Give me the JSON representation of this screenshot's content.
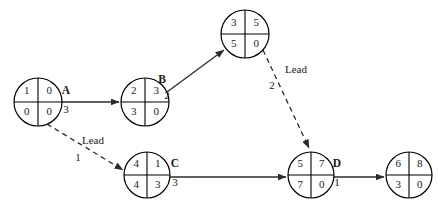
{
  "diagram": {
    "type": "precedence-network-diagram",
    "background": "#ffffff",
    "line_color": "#2b2b2b",
    "text_color": "#1a1a1a",
    "nodes": [
      {
        "id": "node-1",
        "cx": 38,
        "cy": 102,
        "r": 24,
        "top_left": "1",
        "top_right": "0",
        "bottom_left": "0",
        "bottom_right": "0"
      },
      {
        "id": "node-2",
        "cx": 145,
        "cy": 102,
        "r": 24,
        "top_left": "2",
        "top_right": "3",
        "bottom_left": "3",
        "bottom_right": "0"
      },
      {
        "id": "node-3",
        "cx": 245,
        "cy": 34,
        "r": 24,
        "top_left": "3",
        "top_right": "5",
        "bottom_left": "5",
        "bottom_right": "0"
      },
      {
        "id": "node-4",
        "cx": 147,
        "cy": 175,
        "r": 23,
        "top_left": "4",
        "top_right": "1",
        "bottom_left": "4",
        "bottom_right": "3"
      },
      {
        "id": "node-5",
        "cx": 311,
        "cy": 175,
        "r": 23,
        "top_left": "5",
        "top_right": "7",
        "bottom_left": "7",
        "bottom_right": "0"
      },
      {
        "id": "node-6",
        "cx": 409,
        "cy": 175,
        "r": 23,
        "top_left": "6",
        "top_right": "8",
        "bottom_left": "3",
        "bottom_right": "0"
      }
    ],
    "activities": [
      {
        "id": "activity-a",
        "label": "A",
        "duration": "3",
        "label_x": 66,
        "label_y": 91,
        "dur_x": 66,
        "dur_y": 110
      },
      {
        "id": "activity-b",
        "label": "B",
        "duration": "2",
        "label_x": 162,
        "label_y": 80,
        "dur_x": 167,
        "dur_y": 96
      },
      {
        "id": "activity-c",
        "label": "C",
        "duration": "3",
        "label_x": 175,
        "label_y": 164,
        "dur_x": 175,
        "dur_y": 183
      },
      {
        "id": "activity-d",
        "label": "D",
        "duration": "1",
        "label_x": 337,
        "label_y": 164,
        "dur_x": 337,
        "dur_y": 183
      }
    ],
    "leads": [
      {
        "id": "lead-1",
        "label": "Lead",
        "value": "1",
        "label_x": 93,
        "label_y": 141,
        "value_x": 78,
        "value_y": 158
      },
      {
        "id": "lead-2",
        "label": "Lead",
        "value": "2",
        "label_x": 296,
        "label_y": 70,
        "value_x": 272,
        "value_y": 86
      }
    ],
    "links": [
      {
        "id": "link-a",
        "style": "solid",
        "from": "node-1",
        "to": "node-2",
        "x1": 62,
        "y1": 102,
        "x2": 119,
        "y2": 102
      },
      {
        "id": "link-b",
        "style": "solid",
        "from": "node-2",
        "to": "node-3",
        "x1": 167,
        "y1": 92,
        "x2": 224,
        "y2": 50
      },
      {
        "id": "link-c",
        "style": "solid",
        "from": "node-4",
        "to": "node-5",
        "x1": 170,
        "y1": 177,
        "x2": 286,
        "y2": 177
      },
      {
        "id": "link-d",
        "style": "solid",
        "from": "node-5",
        "to": "node-6",
        "x1": 334,
        "y1": 177,
        "x2": 384,
        "y2": 177
      },
      {
        "id": "link-lead-1",
        "style": "dashed",
        "from": "node-1",
        "to": "node-4",
        "x1": 47,
        "y1": 124,
        "x2": 123,
        "y2": 170
      },
      {
        "id": "link-lead-2",
        "style": "dashed",
        "from": "node-3",
        "to": "node-5",
        "x1": 263,
        "y1": 50,
        "x2": 309,
        "y2": 148
      }
    ]
  }
}
